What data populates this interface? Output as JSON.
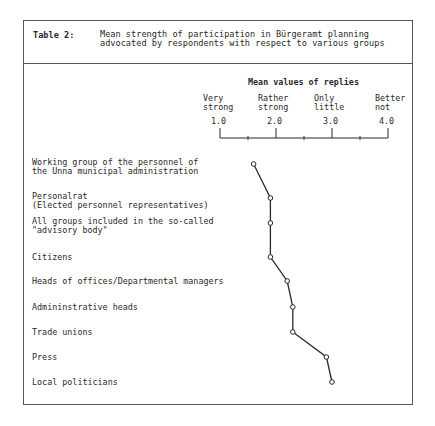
{
  "header": {
    "label": "Table 2:",
    "title_line1": "Mean strength of participation in Bürgeramt planning",
    "title_line2": "advocated by respondents with respect to various groups"
  },
  "axis": {
    "title": "Mean values of replies",
    "categories": [
      {
        "line1": "Very",
        "line2": "strong",
        "tick": "1.0"
      },
      {
        "line1": "Rather",
        "line2": "strong",
        "tick": "2.0"
      },
      {
        "line1": "Only",
        "line2": "little",
        "tick": "3.0"
      },
      {
        "line1": "Better",
        "line2": "not",
        "tick": "4.0"
      }
    ]
  },
  "rows": [
    {
      "line1": "Working group of the personnel of",
      "line2": "the Unna municipal administration"
    },
    {
      "line1": "Personalrat",
      "line2": "(Elected personnel representatives)"
    },
    {
      "line1": "All groups included in the so-called",
      "line2": "\"advisory body\""
    },
    {
      "line1": "Citizens",
      "line2": ""
    },
    {
      "line1": "Heads of offices/Departmental managers",
      "line2": ""
    },
    {
      "line1": "Admininstrative heads",
      "line2": ""
    },
    {
      "line1": "Trade unions",
      "line2": ""
    },
    {
      "line1": "Press",
      "line2": ""
    },
    {
      "line1": "Local politicians",
      "line2": ""
    }
  ],
  "chart_data": {
    "type": "line",
    "title": "Table 2: Mean strength of participation in Bürgeramt planning advocated by respondents with respect to various groups",
    "xlabel": "Mean values of replies",
    "ylabel": "",
    "xlim": [
      1.0,
      4.0
    ],
    "x_ticks": [
      1.0,
      2.0,
      3.0,
      4.0
    ],
    "x_tick_labels": [
      "1.0 Very strong",
      "2.0 Rather strong",
      "3.0 Only little",
      "4.0 Better not"
    ],
    "orientation": "horizontal-profile",
    "grid": false,
    "legend": null,
    "categories": [
      "Working group of the personnel of the Unna municipal administration",
      "Personalrat (Elected personnel representatives)",
      "All groups included in the so-called \"advisory body\"",
      "Citizens",
      "Heads of offices/Departmental managers",
      "Admininstrative heads",
      "Trade unions",
      "Press",
      "Local politicians"
    ],
    "values": [
      1.6,
      1.9,
      1.9,
      1.9,
      2.2,
      2.3,
      2.3,
      2.9,
      3.0
    ]
  },
  "layout": {
    "axis_x0": 220,
    "axis_unit": 56,
    "axis_y": 138,
    "row_y": [
      164,
      198,
      223,
      257,
      281,
      307,
      332,
      357,
      382
    ],
    "line_color": "#2a2a2a"
  }
}
